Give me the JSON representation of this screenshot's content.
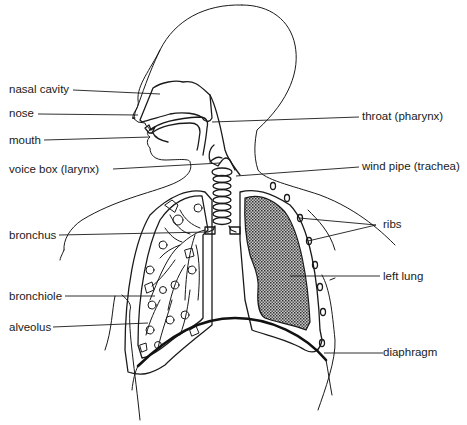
{
  "diagram": {
    "labels": {
      "nasal_cavity": "nasal cavity",
      "nose": "nose",
      "mouth": "mouth",
      "voice_box": "voice box (larynx)",
      "throat": "throat (pharynx)",
      "wind_pipe": "wind pipe (trachea)",
      "bronchus": "bronchus",
      "ribs": "ribs",
      "left_lung": "left lung",
      "bronchiole": "bronchiole",
      "alveolus": "alveolus",
      "diaphragm": "diaphragm"
    },
    "colors": {
      "line": "#1a1a1a",
      "background": "#ffffff",
      "lung_fill": "#8a8a8a"
    }
  }
}
